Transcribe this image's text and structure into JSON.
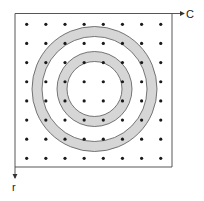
{
  "diagram": {
    "axes": {
      "x_label": "C",
      "y_label": "r"
    },
    "frame": {
      "x": 15,
      "y": 13.5,
      "width": 157,
      "height": 153.5
    },
    "grid": {
      "rows": 8,
      "cols": 8,
      "x0": 26.7,
      "y0": 24.3,
      "dx": 19.15,
      "dy": 19.15,
      "dot_radius": 1.6
    },
    "rings": [
      {
        "name": "outer-ring",
        "cx": 94.5,
        "cy": 89,
        "r_outer": 62.5,
        "r_inner": 52.5
      },
      {
        "name": "inner-ring",
        "cx": 94.5,
        "cy": 89,
        "r_outer": 37.5,
        "r_inner": 27.5
      }
    ],
    "colors": {
      "ring_fill": "#d6d6d6",
      "ring_stroke": "#555555",
      "frame_stroke": "#444444",
      "dot": "#1a1a1a",
      "background": "#ffffff"
    }
  }
}
